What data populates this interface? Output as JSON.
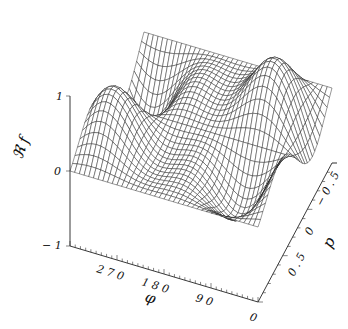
{
  "chart_data": {
    "type": "surface",
    "title": "",
    "zlabel": "ℜ f",
    "xlabel": "φ",
    "ylabel": "p",
    "x_axis": {
      "name": "φ",
      "range": [
        0,
        360
      ],
      "ticks": [
        0,
        90,
        180,
        270
      ],
      "tick_labels": [
        "0",
        "9 0",
        "1 8 0",
        "2 7 0"
      ]
    },
    "y_axis": {
      "name": "p",
      "range": [
        -0.75,
        0.75
      ],
      "ticks": [
        -0.5,
        0,
        0.5
      ],
      "tick_labels": [
        "− 0 . 5",
        "0",
        "0 . 5"
      ]
    },
    "z_axis": {
      "name": "ℜ f",
      "range": [
        -1,
        1
      ],
      "ticks": [
        -1,
        0,
        1
      ],
      "tick_labels": [
        "− 1",
        "0",
        "1"
      ]
    },
    "grid": false,
    "legend": null,
    "style": "wireframe mesh, black lines on white",
    "surface_description": "Real part of f over (φ, p); a large peak (~+1) near φ≈180–270 at p≈-0.5, a trough (~-0.8) near φ≈270, p≈0.5; value 0 along p=0 edges",
    "mesh_resolution": {
      "phi_lines": 40,
      "p_lines": 30
    },
    "colors": {
      "line": "#1a1a1a",
      "background": "#ffffff"
    }
  },
  "labels": {
    "z_title": "ℜ f",
    "phi_title": "φ",
    "p_title": "p",
    "z_ticks": [
      "1",
      "0",
      "− 1"
    ],
    "phi_ticks": [
      "2 7 0",
      "1 8 0",
      "9 0",
      "0"
    ],
    "p_ticks": [
      "− 0 . 5",
      "0",
      "0 . 5"
    ]
  }
}
